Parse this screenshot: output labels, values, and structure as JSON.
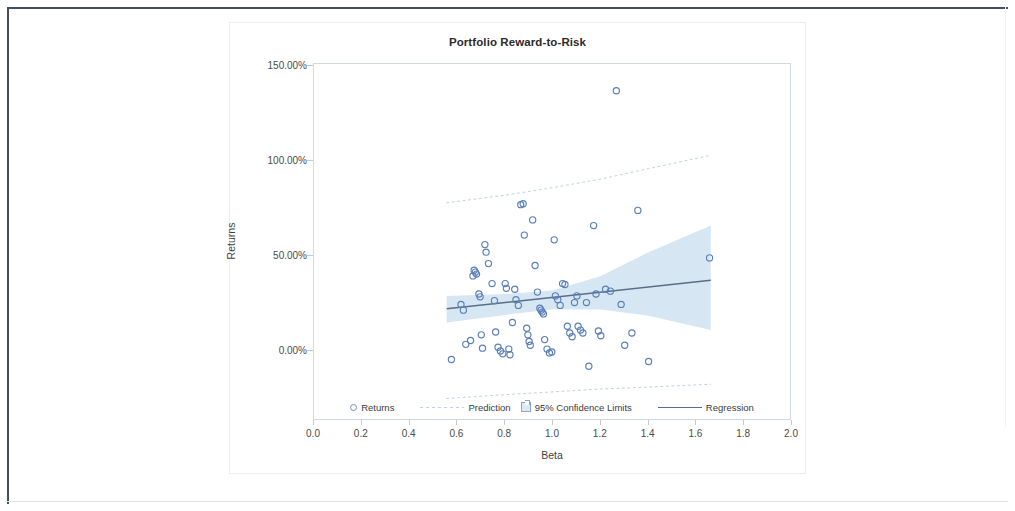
{
  "chart_data": {
    "type": "scatter",
    "title": "Portfolio Reward-to-Risk",
    "xlabel": "Beta",
    "ylabel": "Returns",
    "xlim": [
      0.0,
      2.0
    ],
    "ylim": [
      -0.25,
      1.6
    ],
    "grid": false,
    "legend_position": "bottom-inside",
    "xticks": [
      "0.0",
      "0.2",
      "0.4",
      "0.6",
      "0.8",
      "1.0",
      "1.2",
      "1.4",
      "1.6",
      "1.8",
      "2.0"
    ],
    "xtick_values": [
      0.0,
      0.2,
      0.4,
      0.6,
      0.8,
      1.0,
      1.2,
      1.4,
      1.6,
      1.8,
      2.0
    ],
    "yticks": [
      "0.00%",
      "50.00%",
      "100.00%",
      "150.00%"
    ],
    "ytick_values": [
      0.0,
      0.5,
      1.0,
      1.5
    ],
    "series": [
      {
        "name": "Returns",
        "type": "scatter",
        "marker": "open-circle",
        "color": "#5a7fb8",
        "points": [
          [
            0.575,
            -0.045
          ],
          [
            0.615,
            0.245
          ],
          [
            0.625,
            0.215
          ],
          [
            0.635,
            0.035
          ],
          [
            0.655,
            0.055
          ],
          [
            0.665,
            0.395
          ],
          [
            0.67,
            0.425
          ],
          [
            0.675,
            0.415
          ],
          [
            0.68,
            0.405
          ],
          [
            0.69,
            0.3
          ],
          [
            0.695,
            0.285
          ],
          [
            0.7,
            0.085
          ],
          [
            0.705,
            0.015
          ],
          [
            0.715,
            0.56
          ],
          [
            0.72,
            0.52
          ],
          [
            0.73,
            0.46
          ],
          [
            0.745,
            0.355
          ],
          [
            0.755,
            0.265
          ],
          [
            0.76,
            0.1
          ],
          [
            0.77,
            0.02
          ],
          [
            0.78,
            0.0
          ],
          [
            0.79,
            -0.015
          ],
          [
            0.8,
            0.355
          ],
          [
            0.805,
            0.33
          ],
          [
            0.815,
            0.01
          ],
          [
            0.82,
            -0.02
          ],
          [
            0.83,
            0.15
          ],
          [
            0.84,
            0.325
          ],
          [
            0.845,
            0.27
          ],
          [
            0.855,
            0.24
          ],
          [
            0.865,
            0.77
          ],
          [
            0.875,
            0.775
          ],
          [
            0.88,
            0.61
          ],
          [
            0.89,
            0.12
          ],
          [
            0.895,
            0.085
          ],
          [
            0.9,
            0.05
          ],
          [
            0.905,
            0.03
          ],
          [
            0.915,
            0.69
          ],
          [
            0.925,
            0.45
          ],
          [
            0.935,
            0.31
          ],
          [
            0.945,
            0.225
          ],
          [
            0.95,
            0.215
          ],
          [
            0.955,
            0.205
          ],
          [
            0.96,
            0.195
          ],
          [
            0.965,
            0.06
          ],
          [
            0.975,
            0.01
          ],
          [
            0.985,
            -0.01
          ],
          [
            0.995,
            -0.005
          ],
          [
            1.005,
            0.585
          ],
          [
            1.01,
            0.29
          ],
          [
            1.02,
            0.27
          ],
          [
            1.03,
            0.24
          ],
          [
            1.04,
            0.355
          ],
          [
            1.05,
            0.35
          ],
          [
            1.06,
            0.13
          ],
          [
            1.07,
            0.095
          ],
          [
            1.08,
            0.075
          ],
          [
            1.09,
            0.255
          ],
          [
            1.1,
            0.29
          ],
          [
            1.105,
            0.13
          ],
          [
            1.115,
            0.11
          ],
          [
            1.125,
            0.095
          ],
          [
            1.14,
            0.255
          ],
          [
            1.15,
            -0.08
          ],
          [
            1.17,
            0.66
          ],
          [
            1.18,
            0.3
          ],
          [
            1.19,
            0.105
          ],
          [
            1.2,
            0.08
          ],
          [
            1.22,
            0.325
          ],
          [
            1.24,
            0.315
          ],
          [
            1.265,
            1.37
          ],
          [
            1.285,
            0.245
          ],
          [
            1.3,
            0.03
          ],
          [
            1.33,
            0.095
          ],
          [
            1.355,
            0.74
          ],
          [
            1.4,
            -0.055
          ],
          [
            1.655,
            0.49
          ]
        ]
      },
      {
        "name": "Regression",
        "type": "line",
        "color": "#5a6d87",
        "x": [
          0.555,
          1.66
        ],
        "y": [
          0.222,
          0.372
        ]
      },
      {
        "name": "95% Confidence Limits",
        "type": "band",
        "fill": "#d6e7f3",
        "x": [
          0.555,
          0.8,
          1.0,
          1.2,
          1.4,
          1.66
        ],
        "upper": [
          0.29,
          0.3,
          0.318,
          0.395,
          0.52,
          0.66
        ],
        "lower": [
          0.15,
          0.19,
          0.22,
          0.218,
          0.185,
          0.11
        ]
      },
      {
        "name": "Prediction",
        "type": "dotted-band",
        "color": "#c3cfe4",
        "x": [
          0.555,
          0.8,
          1.0,
          1.2,
          1.4,
          1.66
        ],
        "upper": [
          0.78,
          0.82,
          0.86,
          0.905,
          0.96,
          1.03
        ],
        "lower": [
          -0.25,
          -0.23,
          -0.215,
          -0.2,
          -0.19,
          -0.175
        ]
      }
    ],
    "legend": [
      {
        "label": "Returns",
        "marker": "open-circle"
      },
      {
        "label": "Prediction",
        "marker": "dotted-line"
      },
      {
        "label": "95% Confidence Limits",
        "marker": "filled-box"
      },
      {
        "label": "Regression",
        "marker": "solid-line"
      }
    ]
  },
  "colors": {
    "marker_stroke": "#5a7fb8",
    "regression_line": "#5a6d87",
    "confidence_fill": "#d6e7f3",
    "prediction_dots": "#c3cfe4",
    "axis": "#d3d9e0",
    "text": "#3a3a3a"
  }
}
